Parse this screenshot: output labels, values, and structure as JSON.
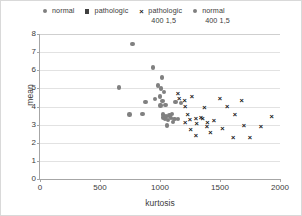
{
  "chart_data": {
    "type": "scatter",
    "title": "",
    "xlabel": "kurtosis",
    "ylabel": "mean",
    "xlim": [
      0,
      2000
    ],
    "ylim": [
      0,
      8
    ],
    "xticks": [
      0,
      500,
      1000,
      1500,
      2000
    ],
    "yticks": [
      0,
      1,
      2,
      3,
      4,
      5,
      6,
      7,
      8
    ],
    "grid": true,
    "legend_position": "top",
    "series": [
      {
        "name": "normal",
        "marker": "circle",
        "color": "#808080",
        "points": [
          [
            660,
            5.05
          ],
          [
            770,
            7.45
          ],
          [
            880,
            4.25
          ],
          [
            940,
            6.15
          ],
          [
            960,
            4.4
          ],
          [
            1000,
            4.55
          ],
          [
            1005,
            4.05
          ],
          [
            1010,
            5.0
          ],
          [
            1015,
            5.6
          ],
          [
            1020,
            4.3
          ],
          [
            1025,
            3.55
          ],
          [
            1030,
            3.4
          ],
          [
            1040,
            3.3
          ],
          [
            1045,
            4.1
          ],
          [
            1050,
            3.45
          ],
          [
            1060,
            2.95
          ],
          [
            1065,
            3.25
          ],
          [
            1080,
            3.5
          ],
          [
            1090,
            3.35
          ],
          [
            1100,
            3.6
          ],
          [
            1110,
            3.15
          ],
          [
            1120,
            3.3
          ],
          [
            1130,
            4.25
          ],
          [
            745,
            3.55
          ],
          [
            855,
            3.6
          ],
          [
            1150,
            3.3
          ],
          [
            1175,
            4.2
          ],
          [
            985,
            5.15
          ],
          [
            1035,
            4.8
          ]
        ]
      },
      {
        "name": "pathologic",
        "marker": "square",
        "color": "#3f3f3f",
        "points": []
      },
      {
        "name": "pathologic 400 1,5",
        "marker": "x",
        "color": "#111111",
        "points": [
          [
            1150,
            4.7
          ],
          [
            1160,
            4.45
          ],
          [
            1205,
            4.35
          ],
          [
            1210,
            4.0
          ],
          [
            1230,
            3.55
          ],
          [
            1250,
            3.3
          ],
          [
            1265,
            4.55
          ],
          [
            1300,
            3.35
          ],
          [
            1305,
            3.05
          ],
          [
            1340,
            3.4
          ],
          [
            1355,
            3.35
          ],
          [
            1370,
            3.95
          ],
          [
            1390,
            2.9
          ],
          [
            1395,
            3.1
          ],
          [
            1420,
            2.55
          ],
          [
            1450,
            3.25
          ],
          [
            1500,
            4.45
          ],
          [
            1520,
            2.8
          ],
          [
            1560,
            4.0
          ],
          [
            1610,
            2.3
          ],
          [
            1625,
            3.55
          ],
          [
            1680,
            4.35
          ],
          [
            1700,
            2.95
          ],
          [
            1750,
            2.3
          ],
          [
            1840,
            2.9
          ],
          [
            1930,
            3.45
          ],
          [
            1210,
            3.1
          ],
          [
            1255,
            2.75
          ],
          [
            1300,
            2.4
          ]
        ]
      },
      {
        "name": "normal 400 1,5",
        "marker": "circle",
        "color": "#808080",
        "points": []
      }
    ]
  },
  "legend": {
    "items": [
      {
        "label_line1": "normal",
        "label_line2": "",
        "marker": "circle"
      },
      {
        "label_line1": "pathologic",
        "label_line2": "",
        "marker": "square"
      },
      {
        "label_line1": "pathologic",
        "label_line2": "400 1,5",
        "marker": "x"
      },
      {
        "label_line1": "normal",
        "label_line2": "400 1,5",
        "marker": "circle"
      }
    ]
  },
  "colors": {
    "normal_marker": "#808080",
    "pathologic_marker": "#3f3f3f",
    "x_marker": "#111111",
    "gridline": "#e2e2e2",
    "axis": "#a6a6a6",
    "text": "#3b3b3b",
    "border": "#d9d9d9"
  }
}
